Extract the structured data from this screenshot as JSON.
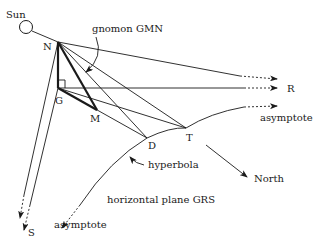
{
  "diagram": {
    "colors": {
      "ink": "#1a1a1a",
      "background": "#ffffff"
    },
    "labels": {
      "sun": "Sun",
      "gnomon": "gnomon GMN",
      "N": "N",
      "G": "G",
      "M": "M",
      "D": "D",
      "T": "T",
      "R": "R",
      "S": "S",
      "asymptote_right": "asymptote",
      "asymptote_left": "asymptote",
      "hyperbola": "hyperbola",
      "north": "North",
      "plane": "horizontal plane GRS"
    },
    "points": {
      "Sun": [
        26,
        27
      ],
      "N": [
        58,
        42
      ],
      "G": [
        58,
        88
      ],
      "M": [
        97,
        110
      ],
      "D": [
        147,
        138
      ],
      "T": [
        186,
        128
      ]
    }
  }
}
